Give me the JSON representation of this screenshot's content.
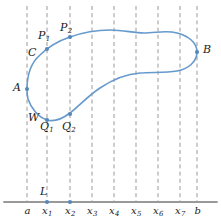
{
  "figure": {
    "colors": {
      "curve": "#6699cc",
      "point": "#5588bb",
      "dashed_line": "#999999",
      "axis": "#999999",
      "label": "#1a1a1a"
    },
    "axis": {
      "name": "x-axis",
      "y": 202,
      "x_start": 4,
      "x_end": 217,
      "ticks": [
        {
          "label": "a",
          "sub": "",
          "x": 27
        },
        {
          "label": "x",
          "sub": "1",
          "x": 47
        },
        {
          "label": "x",
          "sub": "2",
          "x": 70
        },
        {
          "label": "x",
          "sub": "3",
          "x": 92
        },
        {
          "label": "x",
          "sub": "4",
          "x": 114
        },
        {
          "label": "x",
          "sub": "5",
          "x": 136
        },
        {
          "label": "x",
          "sub": "6",
          "x": 158
        },
        {
          "label": "x",
          "sub": "7",
          "x": 180
        },
        {
          "label": "b",
          "sub": "",
          "x": 197
        }
      ]
    },
    "dashed_lines": [
      {
        "name": "gridline-a",
        "x": 27,
        "y_top": 6,
        "y_bottom": 202
      },
      {
        "name": "gridline-x1",
        "x": 47,
        "y_top": 6,
        "y_bottom": 202
      },
      {
        "name": "gridline-x2",
        "x": 70,
        "y_top": 6,
        "y_bottom": 202
      },
      {
        "name": "gridline-x3",
        "x": 92,
        "y_top": 6,
        "y_bottom": 202
      },
      {
        "name": "gridline-x4",
        "x": 114,
        "y_top": 6,
        "y_bottom": 202
      },
      {
        "name": "gridline-x5",
        "x": 136,
        "y_top": 6,
        "y_bottom": 202
      },
      {
        "name": "gridline-x6",
        "x": 158,
        "y_top": 6,
        "y_bottom": 202
      },
      {
        "name": "gridline-x7",
        "x": 180,
        "y_top": 6,
        "y_bottom": 202
      },
      {
        "name": "gridline-b",
        "x": 197,
        "y_top": 6,
        "y_bottom": 202
      }
    ],
    "curve": {
      "name": "closed-curve",
      "path": "M 27 89 C 27 74 32 62 40 55 C 48 47 58 41 70 37 C 84 32 97 30 110 30 C 124 30 133 33 144 33 C 156 33 166 30 177 33 C 189 36 197 43 197 52 C 197 62 188 69 177 71 C 165 73 152 72 140 73 C 125 74 112 80 100 88 C 88 96 80 105 70 113 C 62 119 54 122 47 120 C 38 117 31 108 28 99 C 27 95 27 92 27 89 Z"
    },
    "points": [
      {
        "name": "point-A",
        "x": 27,
        "y": 89
      },
      {
        "name": "point-P1",
        "x": 47,
        "y": 49
      },
      {
        "name": "point-P2",
        "x": 70,
        "y": 37
      },
      {
        "name": "point-B",
        "x": 197,
        "y": 52
      },
      {
        "name": "point-Q1",
        "x": 47,
        "y": 120
      },
      {
        "name": "point-Q2",
        "x": 70,
        "y": 114
      },
      {
        "name": "point-L",
        "x": 47,
        "y": 202
      },
      {
        "name": "point-x2-axis",
        "x": 70,
        "y": 202
      }
    ],
    "point_labels": [
      {
        "name": "label-P1",
        "text": "P",
        "sub": "1",
        "x": 38,
        "y": 30
      },
      {
        "name": "label-P2",
        "text": "P",
        "sub": "2",
        "x": 60,
        "y": 22
      },
      {
        "name": "label-C",
        "text": "C",
        "sub": "",
        "x": 28,
        "y": 47
      },
      {
        "name": "label-B",
        "text": "B",
        "sub": "",
        "x": 203,
        "y": 44
      },
      {
        "name": "label-A",
        "text": "A",
        "sub": "",
        "x": 13,
        "y": 82
      },
      {
        "name": "label-W",
        "text": "W",
        "sub": "",
        "x": 28,
        "y": 112
      },
      {
        "name": "label-Q1",
        "text": "Q",
        "sub": "1",
        "x": 40,
        "y": 121
      },
      {
        "name": "label-Q2",
        "text": "Q",
        "sub": "2",
        "x": 62,
        "y": 121
      },
      {
        "name": "label-L",
        "text": "L",
        "sub": "",
        "x": 40,
        "y": 186
      }
    ]
  }
}
